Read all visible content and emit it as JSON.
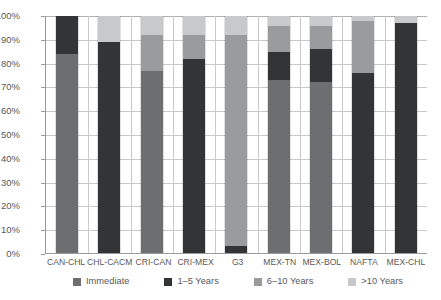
{
  "chart_data": {
    "type": "bar",
    "title": "",
    "subtitle": "",
    "xlabel": "",
    "ylabel": "",
    "stacked": true,
    "orientation": "vertical",
    "grid": true,
    "legend_position": "bottom",
    "ylim": [
      0,
      100
    ],
    "y_unit": "%",
    "y_ticks": [
      "0%",
      "10%",
      "20%",
      "30%",
      "40%",
      "50%",
      "60%",
      "70%",
      "80%",
      "90%",
      "100%"
    ],
    "y_tick_values": [
      0,
      10,
      20,
      30,
      40,
      50,
      60,
      70,
      80,
      90,
      100
    ],
    "categories": [
      "CAN-CHL",
      "CHL-CACM",
      "CRI-CAN",
      "CRI-MEX",
      "G3",
      "MEX-TN",
      "MEX-BOL",
      "NAFTA",
      "MEX-CHL"
    ],
    "series": [
      {
        "name": "Immediate",
        "color": "#6d6e70",
        "values": [
          84,
          0,
          77,
          0,
          0,
          73,
          72,
          0,
          0
        ]
      },
      {
        "name": "1–5 Years",
        "color": "#333436",
        "values": [
          16,
          89,
          0,
          82,
          3,
          12,
          14,
          76,
          97
        ]
      },
      {
        "name": "6–10 Years",
        "color": "#9a9b9d",
        "values": [
          0,
          0,
          15,
          10,
          89,
          11,
          10,
          22,
          0
        ]
      },
      {
        "name": ">10 Years",
        "color": "#c8c9cb",
        "values": [
          0,
          11,
          8,
          8,
          8,
          4,
          4,
          2,
          3
        ]
      }
    ],
    "legend": [
      {
        "label": "Immediate",
        "color": "#6d6e70"
      },
      {
        "label": "1–5 Years",
        "color": "#333436"
      },
      {
        "label": "6–10 Years",
        "color": "#9a9b9d"
      },
      {
        "label": ">10 Years",
        "color": "#c8c9cb"
      }
    ]
  },
  "colors": {
    "axis": "#9b9b9b",
    "grid": "#c9c9c9",
    "text": "#58595b",
    "background": "#ffffff"
  }
}
